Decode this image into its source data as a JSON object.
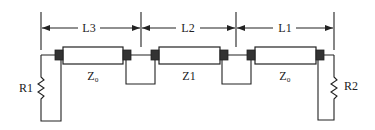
{
  "diagram": {
    "type": "cable-cascade-schematic",
    "dimensions": [
      {
        "label": "L3"
      },
      {
        "label": "L2"
      },
      {
        "label": "L1"
      }
    ],
    "segments": [
      {
        "impedance_label": "Z₀"
      },
      {
        "impedance_label": "Z1"
      },
      {
        "impedance_label": "Z₀"
      }
    ],
    "terminations": {
      "left": {
        "label": "R1"
      },
      "right": {
        "label": "R2"
      }
    },
    "line_color": "#222222",
    "background": "#ffffff"
  }
}
